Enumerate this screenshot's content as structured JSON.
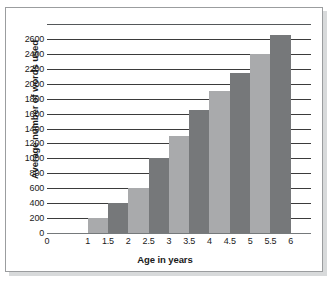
{
  "chart_data": {
    "type": "bar",
    "title": "",
    "xlabel": "Age in years",
    "ylabel": "Average number of words used",
    "categories": [
      "1.5",
      "2",
      "2.5",
      "3",
      "3.5",
      "4",
      "4.5",
      "5",
      "5.5",
      "6"
    ],
    "values": [
      200,
      400,
      600,
      1000,
      1300,
      1650,
      1900,
      2150,
      2400,
      2650
    ],
    "bar_colors": [
      "#a9aaac",
      "#76787a",
      "#a9aaac",
      "#76787a",
      "#a9aaac",
      "#76787a",
      "#a9aaac",
      "#76787a",
      "#a9aaac",
      "#76787a"
    ],
    "x_tick_labels": [
      "0",
      "1",
      "1.5",
      "2",
      "2.5",
      "3",
      "3.5",
      "4",
      "4.5",
      "5",
      "5.5",
      "6"
    ],
    "y_tick_labels": [
      "2600",
      "2400",
      "2200",
      "2000",
      "1800",
      "1600",
      "1400",
      "1200",
      "1000",
      "800",
      "600",
      "400",
      "200",
      "0"
    ],
    "y_tick_values": [
      2600,
      2400,
      2200,
      2000,
      1800,
      1600,
      1400,
      1200,
      1000,
      800,
      600,
      400,
      200,
      0
    ],
    "ylim": [
      0,
      2800
    ],
    "xlim": [
      0,
      6.5
    ],
    "grid": true,
    "legend": "none",
    "grid_color": "#3b3b3b",
    "background_color": "#ffffff",
    "frame_border_color": "#9b9d9f"
  }
}
